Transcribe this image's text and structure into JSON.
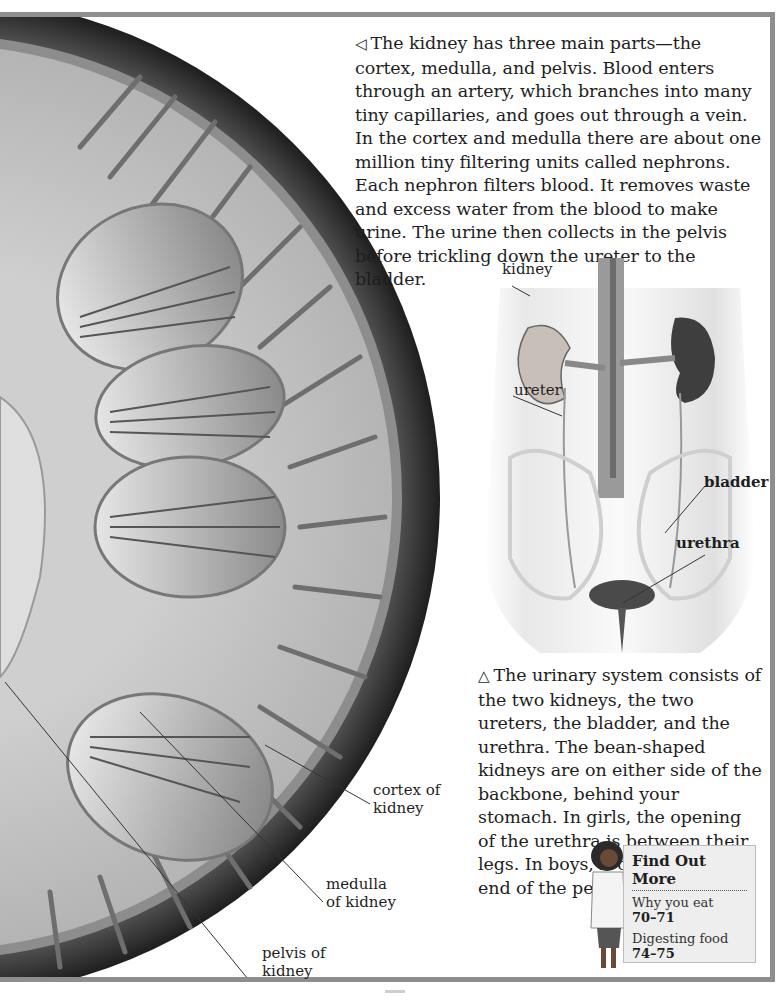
{
  "captions": {
    "kidney_structure": {
      "arrow": "◁",
      "text": "The kidney has three main parts—the cortex, medulla, and pelvis. Blood enters through an artery, which branches into many tiny capillaries, and goes out through a vein. In the cortex and medulla there are about one million tiny filtering units called nephrons. Each nephron filters blood. It removes waste and excess water from the blood to make urine. The urine then collects in the pelvis before trickling down the ureter to the bladder."
    },
    "urinary_system": {
      "arrow": "△",
      "text": "The urinary system consists of the two kidneys, the two ureters, the bladder, and the urethra. The bean-shaped kidneys are on either side of the backbone, behind your stomach. In girls, the opening of the urethra is between their legs. In boys, it opens at the end of the penis."
    }
  },
  "kidney_section_labels": {
    "cortex": [
      "cortex of",
      "kidney"
    ],
    "medulla": [
      "medulla",
      "of kidney"
    ],
    "pelvis": [
      "pelvis of",
      "kidney"
    ]
  },
  "urinary_labels": {
    "kidney": "kidney",
    "ureter": "ureter",
    "bladder": "bladder",
    "urethra": "urethra"
  },
  "find_out_more": {
    "title": "Find Out More",
    "items": [
      {
        "topic": "Why you eat",
        "pages": "70–71"
      },
      {
        "topic": "Digesting food",
        "pages": "74–75"
      }
    ]
  },
  "colors": {
    "frame": "#8e8e8e",
    "kidney_outer": "#3a3a3a",
    "kidney_cortex": "#b9b9b9",
    "text": "#1e1e1e",
    "box_bg": "#eeeeee"
  }
}
